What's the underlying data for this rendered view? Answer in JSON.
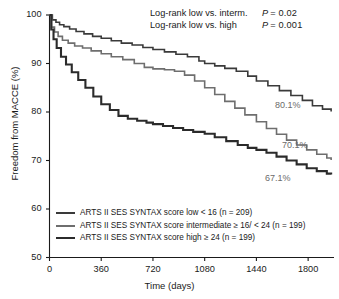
{
  "chart_data": {
    "type": "line",
    "subtype": "kaplan-meier-survival",
    "title": "",
    "xlabel": "Time (days)",
    "ylabel": "Freedom from MACCE (%)",
    "xlim": [
      0,
      1980
    ],
    "ylim": [
      50,
      100
    ],
    "xticks": [
      0,
      360,
      720,
      1080,
      1440,
      1800
    ],
    "xticklabels": [
      "0",
      "360",
      "720",
      "1080",
      "1440",
      "1800"
    ],
    "yticks": [
      50,
      60,
      70,
      80,
      90,
      100
    ],
    "yticklabels": [
      "50",
      "60",
      "70",
      "80",
      "90",
      "100"
    ],
    "grid": false,
    "legend_position": "lower-left",
    "series": [
      {
        "name": "ARTS II SES SYNTAX score low < 16 (n = 209)",
        "group": "low",
        "n": 209,
        "color": "#3a3a3a",
        "width": 1.6,
        "endpoint_label": "80.1%",
        "endpoint_value": 80.1,
        "x": [
          0,
          20,
          45,
          70,
          100,
          140,
          185,
          240,
          300,
          360,
          430,
          500,
          575,
          650,
          720,
          800,
          880,
          960,
          1040,
          1080,
          1150,
          1220,
          1300,
          1380,
          1440,
          1520,
          1600,
          1680,
          1760,
          1830,
          1900,
          1960
        ],
        "y": [
          100,
          99.0,
          98.5,
          98.0,
          97.6,
          97.1,
          96.6,
          96.1,
          95.6,
          95.2,
          94.7,
          94.2,
          93.8,
          93.3,
          92.9,
          92.4,
          91.9,
          91.4,
          90.5,
          90.0,
          89.5,
          89.0,
          88.4,
          87.4,
          86.4,
          85.4,
          84.4,
          83.4,
          82.4,
          81.3,
          80.6,
          80.1
        ]
      },
      {
        "name": "ARTS II SES SYNTAX score intermediate ≥ 16/ < 24 (n = 199)",
        "group": "intermediate",
        "n": 199,
        "color": "#6e6e6e",
        "width": 1.6,
        "endpoint_label": "70.1%",
        "endpoint_value": 70.1,
        "x": [
          0,
          15,
          35,
          60,
          90,
          130,
          175,
          230,
          290,
          360,
          430,
          510,
          590,
          660,
          720,
          800,
          870,
          940,
          1010,
          1080,
          1150,
          1220,
          1290,
          1360,
          1440,
          1510,
          1580,
          1650,
          1720,
          1790,
          1860,
          1930,
          1960
        ],
        "y": [
          100,
          97.5,
          96.5,
          95.6,
          94.8,
          94.2,
          93.6,
          93.2,
          92.6,
          92.0,
          91.4,
          90.8,
          90.0,
          89.2,
          88.9,
          88.7,
          88.4,
          87.6,
          86.4,
          85.0,
          83.6,
          82.2,
          80.8,
          79.4,
          78.0,
          76.6,
          75.4,
          74.2,
          73.2,
          72.2,
          71.3,
          70.5,
          70.1
        ]
      },
      {
        "name": "ARTS II SES SYNTAX score high ≥ 24 (n = 199)",
        "group": "high",
        "n": 199,
        "color": "#2b2b2b",
        "width": 2.1,
        "endpoint_label": "67.1%",
        "endpoint_value": 67.1,
        "x": [
          0,
          12,
          28,
          50,
          80,
          115,
          155,
          200,
          250,
          305,
          360,
          420,
          480,
          545,
          610,
          675,
          720,
          790,
          860,
          930,
          1000,
          1080,
          1150,
          1230,
          1310,
          1380,
          1440,
          1510,
          1580,
          1650,
          1720,
          1790,
          1860,
          1930,
          1960
        ],
        "y": [
          100,
          97.0,
          95.0,
          93.2,
          91.4,
          89.8,
          88.2,
          86.6,
          85.0,
          83.2,
          81.6,
          80.4,
          79.2,
          78.6,
          78.2,
          77.8,
          77.5,
          77.1,
          76.7,
          76.3,
          75.9,
          75.5,
          74.8,
          74.0,
          73.2,
          72.6,
          72.2,
          71.6,
          70.8,
          70.0,
          69.2,
          68.4,
          67.8,
          67.3,
          67.1
        ]
      }
    ],
    "annotations": [
      {
        "label": "Log-rank low vs. interm.",
        "stat": "P",
        "value": "= 0.02"
      },
      {
        "label": "Log-rank low vs. high",
        "stat": "P",
        "value": "= 0.001"
      }
    ],
    "endpoint_labels": [
      {
        "text": "80.1%",
        "series": "low"
      },
      {
        "text": "70.1%",
        "series": "intermediate"
      },
      {
        "text": "67.1%",
        "series": "high"
      }
    ]
  },
  "legend": {
    "items": [
      {
        "label": "ARTS II SES SYNTAX score low < 16 (n = 209)"
      },
      {
        "label": "ARTS II SES SYNTAX score intermediate ≥ 16/ < 24 (n = 199)"
      },
      {
        "label": "ARTS II SES SYNTAX score high ≥ 24 (n = 199)"
      }
    ]
  },
  "colors": {
    "axis": "#1a1a1a",
    "text": "#1a1a1a",
    "endpoint_text": "#6b6b6b",
    "background": "#ffffff"
  }
}
